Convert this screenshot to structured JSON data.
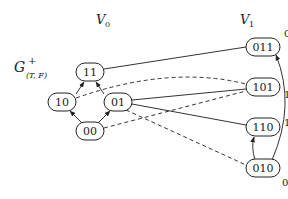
{
  "diagram": {
    "title": {
      "main": "G",
      "sup": "+",
      "sub": "(T, F)"
    },
    "partitions": [
      {
        "id": "V0",
        "main": "V",
        "sub": "0"
      },
      {
        "id": "V1",
        "main": "V",
        "sub": "1"
      }
    ],
    "nodes": [
      {
        "id": "11",
        "label": "11",
        "x": 90,
        "y": 72,
        "w": 28
      },
      {
        "id": "10",
        "label": "10",
        "x": 62,
        "y": 102,
        "w": 28
      },
      {
        "id": "01",
        "label": "01",
        "x": 118,
        "y": 102,
        "w": 28
      },
      {
        "id": "00",
        "label": "00",
        "x": 90,
        "y": 131,
        "w": 28
      },
      {
        "id": "011",
        "label": "011",
        "x": 263,
        "y": 47,
        "w": 34,
        "weight": "0"
      },
      {
        "id": "101",
        "label": "101",
        "x": 263,
        "y": 87,
        "w": 34,
        "weight": "1"
      },
      {
        "id": "110",
        "label": "110",
        "x": 263,
        "y": 127,
        "w": 34,
        "weight": "1"
      },
      {
        "id": "010",
        "label": "010",
        "x": 263,
        "y": 168,
        "w": 34,
        "weight": "0"
      }
    ],
    "edges": [
      {
        "from": "10",
        "to": "11",
        "style": "solid",
        "arrow": true
      },
      {
        "from": "01",
        "to": "11",
        "style": "solid",
        "arrow": true
      },
      {
        "from": "00",
        "to": "10",
        "style": "solid",
        "arrow": true
      },
      {
        "from": "00",
        "to": "01",
        "style": "solid",
        "arrow": true
      },
      {
        "from": "11",
        "to": "011",
        "style": "solid",
        "arrow": false
      },
      {
        "from": "01",
        "to": "101",
        "style": "solid",
        "arrow": false
      },
      {
        "from": "01",
        "to": "110",
        "style": "solid",
        "arrow": false
      },
      {
        "from": "10",
        "to": "101",
        "style": "dashed",
        "arrow": false
      },
      {
        "from": "00",
        "to": "101",
        "style": "dashed",
        "arrow": false
      },
      {
        "from": "01",
        "to": "010",
        "style": "dashed",
        "arrow": false
      },
      {
        "from": "010",
        "to": "110",
        "style": "solid",
        "arrow": true
      },
      {
        "from": "010",
        "to": "011",
        "style": "solid",
        "arrow": true,
        "curved": true
      }
    ],
    "weights": [
      {
        "node": "011",
        "value": "0"
      },
      {
        "node": "101",
        "value": "1"
      },
      {
        "node": "110",
        "value": "1"
      },
      {
        "node": "010",
        "value": "0"
      }
    ]
  }
}
